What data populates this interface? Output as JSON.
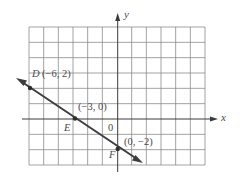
{
  "figure": {
    "axes": {
      "x_label": "x",
      "y_label": "y",
      "origin_label": "0"
    },
    "grid": {
      "x_min": -6,
      "x_max": 6,
      "y_min": -3,
      "y_max": 6,
      "step": 1
    },
    "points": [
      {
        "name": "D",
        "coords_label": "(−6, 2)",
        "x": -6,
        "y": 2
      },
      {
        "name": "E",
        "coords_label": "(−3, 0)",
        "x": -3,
        "y": 0
      },
      {
        "name": "F",
        "coords_label": "(0, −2)",
        "x": 0,
        "y": -2
      }
    ],
    "line": {
      "description": "line through D, E, F with arrows at both ends",
      "slope": "-2/3",
      "y_intercept": -2
    },
    "colors": {
      "grid": "#8a8a8a",
      "axis": "#3a3a3a",
      "line": "#3d3d3d",
      "text": "#4a4a4a"
    }
  }
}
